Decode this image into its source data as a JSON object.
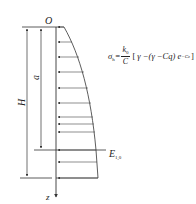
{
  "diagram": {
    "type": "earth-pressure-distribution",
    "labels": {
      "origin": "O",
      "depth_axis": "z",
      "total_height": "H",
      "partial_depth": "a",
      "line_label_main": "E",
      "line_label_sub": "1,0"
    },
    "formula": {
      "lhs_symbol": "σ",
      "lhs_sub": "h",
      "equals": "=",
      "frac_num_symbol": "k",
      "frac_num_sub": "0",
      "frac_den": "C",
      "open_bracket": "[",
      "body": "γ −(γ −Cq) e",
      "exponent": "−Cz",
      "close_bracket": "]"
    },
    "colors": {
      "line": "#333333",
      "text": "#222222",
      "background": "#ffffff"
    },
    "arrow_rows_y": [
      27,
      42,
      57,
      72,
      88,
      103,
      117,
      124,
      132,
      148,
      162,
      178
    ]
  }
}
